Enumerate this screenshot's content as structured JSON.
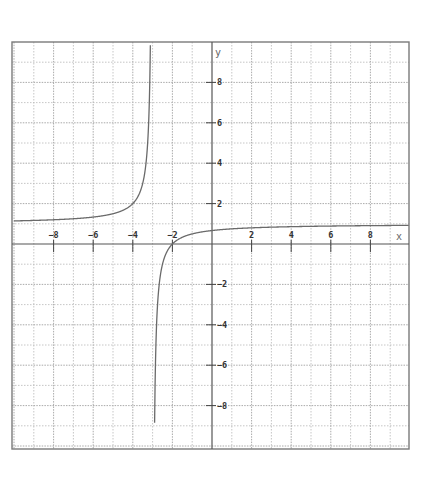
{
  "chart_data": {
    "type": "line",
    "title": "",
    "function": "y = (x + 2) / (x + 3)",
    "xlabel": "x",
    "ylabel": "y",
    "xlim": [
      -10,
      10
    ],
    "ylim": [
      -10,
      10
    ],
    "grid": true,
    "grid_step": 1,
    "x_ticks": [
      -8,
      -6,
      -4,
      -2,
      2,
      4,
      6,
      8
    ],
    "y_ticks": [
      -8,
      -6,
      -4,
      -2,
      2,
      4,
      6,
      8
    ],
    "x_tick_labels": [
      "-8",
      "-6",
      "-4",
      "-2",
      "2",
      "4",
      "6",
      "8"
    ],
    "y_tick_labels": [
      "-8",
      "-6",
      "-4",
      "-2",
      "2",
      "4",
      "6",
      "8"
    ],
    "asymptotes": {
      "vertical": -3,
      "horizontal": 1
    },
    "series": [
      {
        "name": "left branch",
        "x": [
          -10,
          -9,
          -8,
          -7,
          -6,
          -5,
          -4.5,
          -4,
          -3.75,
          -3.5,
          -3.3,
          -3.2,
          -3.12
        ],
        "y": [
          1.14,
          1.17,
          1.2,
          1.25,
          1.33,
          1.5,
          1.67,
          2,
          2.33,
          3,
          4.33,
          6,
          9.33
        ]
      },
      {
        "name": "right branch",
        "x": [
          -2.88,
          -2.8,
          -2.7,
          -2.5,
          -2.25,
          -2,
          -1.5,
          -1,
          0,
          1,
          2,
          4,
          6,
          8,
          10
        ],
        "y": [
          -7.33,
          -4,
          -2.33,
          -1,
          -0.33,
          0,
          0.33,
          0.5,
          0.67,
          0.75,
          0.8,
          0.86,
          0.89,
          0.91,
          0.92
        ]
      }
    ],
    "legend": null
  }
}
